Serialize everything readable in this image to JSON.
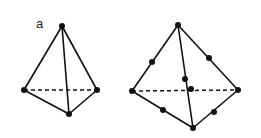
{
  "figure": {
    "panel_label": "a",
    "colors": {
      "line": "#111111",
      "background": "#ffffff"
    },
    "tetrahedra": [
      {
        "name": "linear-tetrahedron",
        "node_count": 4,
        "vertices": {
          "apex": [
            62,
            26
          ],
          "left": [
            24,
            90
          ],
          "right": [
            97,
            90
          ],
          "bottom": [
            69,
            114
          ]
        },
        "mid_nodes": []
      },
      {
        "name": "quadratic-tetrahedron",
        "node_count": 10,
        "vertices": {
          "apex": [
            178,
            25
          ],
          "left": [
            132,
            91
          ],
          "right": [
            238,
            90
          ],
          "bottom": [
            193,
            128
          ]
        },
        "mid_nodes": [
          [
            152,
            62
          ],
          [
            209,
            58
          ],
          [
            185,
            79
          ],
          [
            191,
            89
          ],
          [
            163,
            110
          ],
          [
            214,
            112
          ]
        ]
      }
    ]
  }
}
